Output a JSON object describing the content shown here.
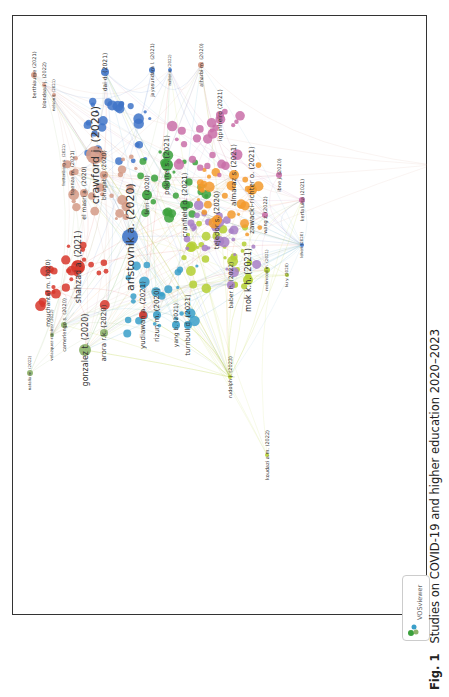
{
  "figure": {
    "label": "Fig. 1",
    "caption": "Studies on COVID-19 and higher education 2020–2023",
    "software_badge": "VOSviewer"
  },
  "network": {
    "type": "bibliographic co-citation network",
    "orientation": "rotated 90 degrees counter-clockwise",
    "clusters": [
      {
        "color": "#d7372b",
        "name": "red"
      },
      {
        "color": "#3f74c8",
        "name": "blue"
      },
      {
        "color": "#3ba13c",
        "name": "green"
      },
      {
        "color": "#b4cf33",
        "name": "yellow-green"
      },
      {
        "color": "#a77fc6",
        "name": "purple"
      },
      {
        "color": "#3a9fc9",
        "name": "cyan"
      },
      {
        "color": "#f39a2d",
        "name": "orange"
      },
      {
        "color": "#d49a86",
        "name": "salmon"
      },
      {
        "color": "#c96fa8",
        "name": "pink"
      },
      {
        "color": "#8db26a",
        "name": "olive-green"
      }
    ],
    "nodes": [
      {
        "label": "crawford j. (2020)",
        "cluster": "salmon",
        "x": 83,
        "y": 140,
        "r": 9,
        "fs": 11
      },
      {
        "label": "aristovnik a. (2020)",
        "cluster": "blue",
        "x": 118,
        "y": 222,
        "r": 8,
        "fs": 11
      },
      {
        "label": "shahzad a. (2021)",
        "cluster": "red",
        "x": 66,
        "y": 252,
        "r": 7,
        "fs": 8
      },
      {
        "label": "gonzalez t. (2020)",
        "cluster": "olive-green",
        "x": 73,
        "y": 335,
        "r": 6,
        "fs": 8
      },
      {
        "label": "mok k.h. (2021)",
        "cluster": "yellow-green",
        "x": 236,
        "y": 265,
        "r": 5,
        "fs": 8
      },
      {
        "label": "baber h. (2022)",
        "cluster": "purple",
        "x": 219,
        "y": 270,
        "r": 4,
        "fs": 6
      },
      {
        "label": "turnbull d. (2021)",
        "cluster": "cyan",
        "x": 176,
        "y": 310,
        "r": 4,
        "fs": 7
      },
      {
        "label": "yang b. (2021)",
        "cluster": "cyan",
        "x": 164,
        "y": 310,
        "r": 4,
        "fs": 6
      },
      {
        "label": "rizun m. (2020)",
        "cluster": "cyan",
        "x": 145,
        "y": 300,
        "r": 4,
        "fs": 7
      },
      {
        "label": "yudiawan a. (2021)",
        "cluster": "red",
        "x": 131,
        "y": 300,
        "r": 4,
        "fs": 7
      },
      {
        "label": "arora r.k. (2020)",
        "cluster": "olive-green",
        "x": 92,
        "y": 318,
        "r": 4,
        "fs": 7
      },
      {
        "label": "mouchantaf m. (2020)",
        "cluster": "red",
        "x": 36,
        "y": 278,
        "r": 3,
        "fs": 6
      },
      {
        "label": "camerlengo s. (2020)",
        "cluster": "olive-green",
        "x": 52,
        "y": 310,
        "r": 3,
        "fs": 5
      },
      {
        "label": "velazquez-ramirez (2022)",
        "cluster": "olive-green",
        "x": 40,
        "y": 320,
        "r": 2,
        "fs": 4
      },
      {
        "label": "natalia m. (2022)",
        "cluster": "olive-green",
        "x": 18,
        "y": 358,
        "r": 3,
        "fs": 4
      },
      {
        "label": "rudolph j. (2023)",
        "cluster": "yellow-green",
        "x": 218,
        "y": 362,
        "r": 2,
        "fs": 5
      },
      {
        "label": "koudazi a.m. (2022)",
        "cluster": "yellow-green",
        "x": 255,
        "y": 440,
        "r": 2,
        "fs": 5
      },
      {
        "label": "bhagat s. (2020)",
        "cluster": "salmon",
        "x": 92,
        "y": 160,
        "r": 4,
        "fs": 6
      },
      {
        "label": "el masri a. (2020)",
        "cluster": "salmon",
        "x": 72,
        "y": 178,
        "r": 4,
        "fs": 6
      },
      {
        "label": "fraenza m. (2021)",
        "cluster": "salmon",
        "x": 60,
        "y": 158,
        "r": 3,
        "fs": 5
      },
      {
        "label": "frettenberg s. (2021)",
        "cluster": "salmon",
        "x": 52,
        "y": 150,
        "r": 2,
        "fs": 4
      },
      {
        "label": "berthiaume (2021)",
        "cluster": "salmon",
        "x": 22,
        "y": 60,
        "r": 3,
        "fs": 5
      },
      {
        "label": "blondeau j. (2022)",
        "cluster": "salmon",
        "x": 32,
        "y": 70,
        "r": 2,
        "fs": 5
      },
      {
        "label": "nelson t. (2021)",
        "cluster": "salmon",
        "x": 42,
        "y": 80,
        "r": 2,
        "fs": 4
      },
      {
        "label": "dai d. (2021)",
        "cluster": "blue",
        "x": 93,
        "y": 57,
        "r": 4,
        "fs": 6
      },
      {
        "label": "jayasundara l. (2021)",
        "cluster": "blue",
        "x": 140,
        "y": 55,
        "r": 3,
        "fs": 5
      },
      {
        "label": "nabor a. (2022)",
        "cluster": "blue",
        "x": 158,
        "y": 55,
        "r": 2,
        "fs": 4
      },
      {
        "label": "alharbi m. (2020)",
        "cluster": "salmon",
        "x": 189,
        "y": 50,
        "r": 3,
        "fs": 5
      },
      {
        "label": "iqpinheiro (2021)",
        "cluster": "pink",
        "x": 208,
        "y": 100,
        "r": 4,
        "fs": 6
      },
      {
        "label": "almaraz s. (2021)",
        "cluster": "orange",
        "x": 222,
        "y": 160,
        "r": 5,
        "fs": 7
      },
      {
        "label": "zawacki-richter o. (2021)",
        "cluster": "orange",
        "x": 240,
        "y": 175,
        "r": 5,
        "fs": 7
      },
      {
        "label": "wang z. (2022)",
        "cluster": "pink",
        "x": 253,
        "y": 200,
        "r": 3,
        "fs": 5
      },
      {
        "label": "ibne j. (2020)",
        "cluster": "pink",
        "x": 267,
        "y": 160,
        "r": 3,
        "fs": 5
      },
      {
        "label": "kerfaluisa (2021)",
        "cluster": "pink",
        "x": 290,
        "y": 185,
        "r": 3,
        "fs": 5
      },
      {
        "label": "leheri (2020)",
        "cluster": "blue",
        "x": 290,
        "y": 230,
        "r": 2,
        "fs": 4
      },
      {
        "label": "ku y. (2020)",
        "cluster": "yellow-green",
        "x": 275,
        "y": 260,
        "r": 2,
        "fs": 4
      },
      {
        "label": "mehmood m. (2021)",
        "cluster": "yellow-green",
        "x": 255,
        "y": 255,
        "r": 3,
        "fs": 4
      },
      {
        "label": "molusyimi g.a. (2020)",
        "cluster": "salmon",
        "x": 420,
        "y": 150,
        "r": 2,
        "fs": 4
      },
      {
        "label": "cranfield d. (2021)",
        "cluster": "green",
        "x": 173,
        "y": 190,
        "r": 5,
        "fs": 7
      },
      {
        "label": "pokhrel s. (2021)",
        "cluster": "green",
        "x": 155,
        "y": 150,
        "r": 6,
        "fs": 7
      },
      {
        "label": "tejedor s. (2020)",
        "cluster": "orange",
        "x": 205,
        "y": 205,
        "r": 5,
        "fs": 7
      },
      {
        "label": "ferri f. (2020)",
        "cluster": "green",
        "x": 135,
        "y": 180,
        "r": 5,
        "fs": 6
      }
    ]
  }
}
